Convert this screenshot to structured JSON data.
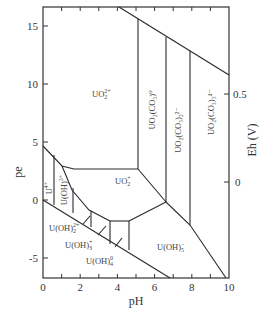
{
  "diagram": {
    "type": "pe-pH (Pourbaix) diagram",
    "x_axis": {
      "label": "pH",
      "ticks": [
        "0",
        "2",
        "4",
        "6",
        "8",
        "10"
      ],
      "range": [
        0,
        10
      ]
    },
    "y_axis_left": {
      "label": "pe",
      "ticks": [
        "15",
        "10",
        "5",
        "0",
        "-5"
      ]
    },
    "y_axis_right": {
      "label": "Eh (V)",
      "ticks": [
        "0.5",
        "0"
      ]
    },
    "regions": [
      {
        "id": "uo2_2plus",
        "base": "UO",
        "sub": "2",
        "sup": "2+"
      },
      {
        "id": "uo2_co3_0",
        "text": "UO₂(CO₃)⁰"
      },
      {
        "id": "uo2_co3_2_2minus",
        "text": "UO₂(CO₃)₂²⁻"
      },
      {
        "id": "uo2_co3_3_4minus",
        "text": "UO₂(CO₃)₃⁴⁻"
      },
      {
        "id": "uo2_plus",
        "base": "UO",
        "sub": "2",
        "sup": "+"
      },
      {
        "id": "u4plus",
        "base": "U",
        "sup": "4+"
      },
      {
        "id": "u_oh_3plus",
        "base": "U(OH)",
        "sup": "3+"
      },
      {
        "id": "u_oh2_2plus",
        "base": "U(OH)",
        "sub": "2",
        "sup": "2+"
      },
      {
        "id": "u_oh3_plus",
        "base": "U(OH)",
        "sub": "3",
        "sup": "+"
      },
      {
        "id": "u_oh4_0",
        "base": "U(OH)",
        "sub": "4",
        "sup": "0"
      },
      {
        "id": "u_oh5_minus",
        "base": "U(OH)",
        "sub": "5",
        "sup": "−"
      }
    ]
  }
}
